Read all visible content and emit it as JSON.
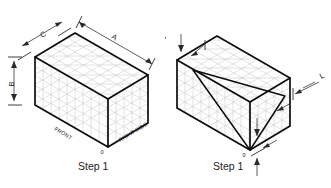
{
  "page": {
    "background_color": "#ffffff",
    "line_color": "#0d0d0d",
    "grid_color": "#c9c9c9",
    "dim_color": "#2a2a2a"
  },
  "figures": [
    {
      "id": "step-1-blocked-in-box",
      "caption": "Step 1",
      "origin_label": "0",
      "dimensions": [
        {
          "key": "A",
          "label": "A",
          "axis": "right-receding-top-edge"
        },
        {
          "key": "B",
          "label": "B",
          "axis": "vertical-left-height"
        },
        {
          "key": "C",
          "label": "C",
          "axis": "left-receding-top-edge"
        }
      ],
      "face_labels": [
        {
          "key": "front",
          "label": "FRONT"
        },
        {
          "key": "right_side",
          "label": "RIGHT SIDE"
        }
      ]
    },
    {
      "id": "step-1-triangular-feature-box",
      "caption": "Step 1",
      "origin_label": "0",
      "dimensions": [
        {
          "key": "L",
          "label": "L",
          "axis": "right-side-leader"
        }
      ],
      "face_labels": [],
      "feature": "triangular-cut-on-front-face"
    }
  ],
  "icons": {
    "arrowhead": "arrow-head-icon",
    "extension_tick": "extension-line-tick-icon"
  }
}
